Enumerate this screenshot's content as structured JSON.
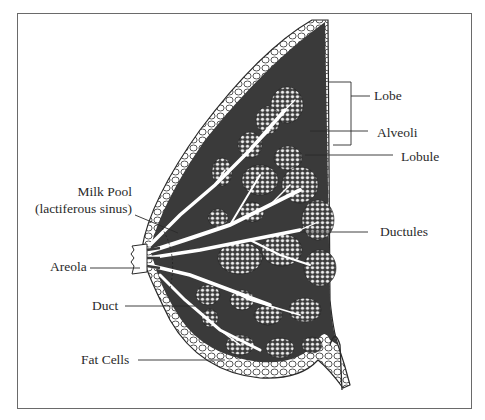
{
  "diagram": {
    "colors": {
      "tissue": "#3a3a3a",
      "ducts": "#ffffff",
      "outline": "#2a2a2a",
      "frame": "#6a6a6a",
      "text": "#2a2a2a"
    },
    "labels": {
      "lobe": "Lobe",
      "alveoli": "Alveoli",
      "lobule": "Lobule",
      "milk_pool": "Milk Pool",
      "milk_pool_sub": "(lactiferous sinus)",
      "ductules": "Ductules",
      "areola": "Areola",
      "duct": "Duct",
      "fat_cells": "Fat Cells"
    }
  }
}
